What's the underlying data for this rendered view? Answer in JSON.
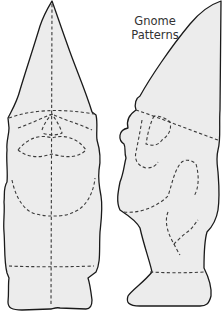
{
  "title": {
    "line1": "Gnome",
    "line2": "Patterns"
  },
  "colors": {
    "background": "#ffffff",
    "pattern_fill": "#ececec",
    "outline": "#1a1a1a",
    "cut_lines": "#3a3a3a",
    "title_text": "#333333"
  },
  "patterns": [
    {
      "view": "front",
      "line_style_outline": "solid",
      "line_style_guides": "dashed"
    },
    {
      "view": "side",
      "line_style_outline": "solid",
      "line_style_guides": "dashed"
    }
  ]
}
